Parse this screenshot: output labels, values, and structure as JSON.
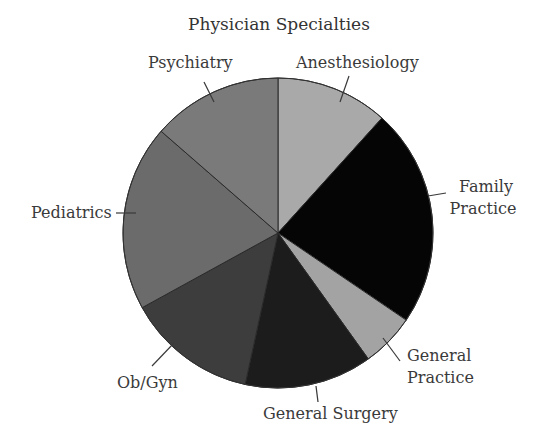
{
  "chart_data": {
    "type": "pie",
    "title": "Physician Specialties",
    "start_angle_deg": 0,
    "direction": "clockwise",
    "legend": "none (direct labels with leader lines)",
    "slices": [
      {
        "label": "Anesthesiology",
        "percent": 11.7,
        "color": "#a9a9a9"
      },
      {
        "label": "Family Practice",
        "percent": 22.8,
        "color": "#050505"
      },
      {
        "label": "General Practice",
        "percent": 5.6,
        "color": "#a3a3a3"
      },
      {
        "label": "General Surgery",
        "percent": 13.3,
        "color": "#1c1c1c"
      },
      {
        "label": "Ob/Gyn",
        "percent": 13.6,
        "color": "#3d3d3d"
      },
      {
        "label": "Pediatrics",
        "percent": 19.4,
        "color": "#6b6b6b"
      },
      {
        "label": "Psychiatry",
        "percent": 13.6,
        "color": "#7a7a7a"
      }
    ],
    "categories": [
      "Anesthesiology",
      "Family Practice",
      "General Practice",
      "General Surgery",
      "Ob/Gyn",
      "Pediatrics",
      "Psychiatry"
    ],
    "values": [
      11.7,
      22.8,
      5.6,
      13.3,
      13.6,
      19.4,
      13.6
    ]
  },
  "labels": {
    "title": "Physician Specialties",
    "anesthesiology": "Anesthesiology",
    "family_1": "Family",
    "family_2": "Practice",
    "general_practice_1": "General",
    "general_practice_2": "Practice",
    "general_surgery": "General Surgery",
    "obgyn": "Ob/Gyn",
    "pediatrics": "Pediatrics",
    "psychiatry": "Psychiatry"
  }
}
